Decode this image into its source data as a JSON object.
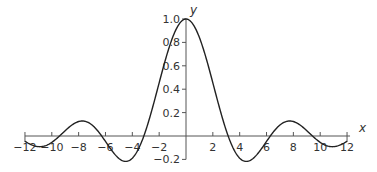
{
  "chart_data": {
    "type": "line",
    "title": "",
    "function": "y = sin(x)/x",
    "xlabel": "x",
    "ylabel": "y",
    "xlim": [
      -12,
      12
    ],
    "ylim": [
      -0.2,
      1.0
    ],
    "grid": false,
    "legend": null,
    "x_ticks": [
      -12,
      -10,
      -8,
      -6,
      -4,
      -2,
      2,
      4,
      6,
      8,
      10,
      12
    ],
    "x_tick_labels": [
      "−12",
      "−10",
      "−8",
      "−6",
      "−4",
      "−2",
      "2",
      "4",
      "6",
      "8",
      "10",
      "12"
    ],
    "y_ticks": [
      -0.2,
      0.2,
      0.4,
      0.6,
      0.8,
      1.0
    ],
    "y_tick_labels": [
      "−0.2",
      "0.2",
      "0.4",
      "0.6",
      "0.8",
      "1.0"
    ],
    "series": [
      {
        "name": "sin(x)/x",
        "x": [
          -12,
          -11,
          -10,
          -9,
          -8,
          -7.725,
          -7,
          -6,
          -5,
          -4.493,
          -4,
          -3,
          -2,
          -1,
          0,
          1,
          2,
          3,
          4,
          4.493,
          5,
          6,
          7,
          7.725,
          8,
          9,
          10,
          11,
          12
        ],
        "values": [
          -0.045,
          -0.091,
          -0.054,
          0.046,
          0.124,
          0.128,
          0.094,
          -0.047,
          -0.192,
          -0.217,
          -0.189,
          0.047,
          0.455,
          0.841,
          1.0,
          0.841,
          0.455,
          0.047,
          -0.189,
          -0.217,
          -0.192,
          -0.047,
          0.094,
          0.128,
          0.124,
          0.046,
          -0.054,
          -0.091,
          -0.045
        ]
      }
    ],
    "box_end_segments": "small rectangles at x ∈ [-12,-10] and [10,12] drawn below axis"
  },
  "colors": {
    "curve": "#222222",
    "axes": "#555555",
    "text": "#333333"
  }
}
